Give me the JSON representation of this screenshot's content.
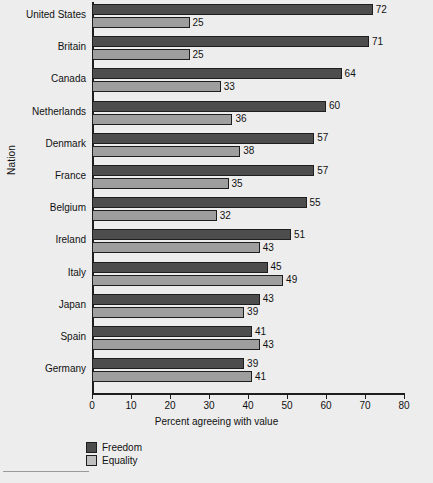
{
  "chart_data": {
    "type": "bar",
    "orientation": "horizontal",
    "title": "",
    "xlabel": "Percent agreeing with value",
    "ylabel": "Nation",
    "xlim": [
      0,
      80
    ],
    "xticks": [
      0,
      10,
      20,
      30,
      40,
      50,
      60,
      70,
      80
    ],
    "grid": false,
    "legend_position": "bottom-left",
    "categories": [
      "United States",
      "Britain",
      "Canada",
      "Netherlands",
      "Denmark",
      "France",
      "Belgium",
      "Ireland",
      "Italy",
      "Japan",
      "Spain",
      "Germany"
    ],
    "series": [
      {
        "name": "Freedom",
        "color": "#4d4d4d",
        "values": [
          72,
          71,
          64,
          60,
          57,
          57,
          55,
          51,
          45,
          43,
          41,
          39
        ]
      },
      {
        "name": "Equality",
        "color": "#9e9e9e",
        "values": [
          25,
          25,
          33,
          36,
          38,
          35,
          32,
          43,
          49,
          39,
          43,
          41
        ]
      }
    ]
  },
  "legend": {
    "items": [
      {
        "label": "Freedom",
        "color": "#4d4d4d"
      },
      {
        "label": "Equality",
        "color": "#bfbfbf"
      }
    ]
  },
  "colors": {
    "background": "#ededed",
    "axis": "#1e1e1e",
    "freedom": "#4d4d4d",
    "equality": "#9e9e9e"
  }
}
